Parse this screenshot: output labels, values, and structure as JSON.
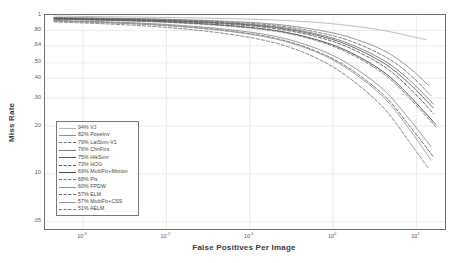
{
  "chart_data": {
    "type": "line",
    "title": "",
    "xlabel": "False Positives Per Image",
    "ylabel": "Miss Rate",
    "xscale": "log",
    "yscale": "log",
    "xlim": [
      0.00035,
      22
    ],
    "ylim": [
      0.045,
      1.0
    ],
    "grid": true,
    "legend_position": "lower-left",
    "xtick_labels": [
      "10-3",
      "10-2",
      "10-1",
      "100",
      "101"
    ],
    "xtick_values": [
      0.001,
      0.01,
      0.1,
      1,
      10
    ],
    "ytick_labels": [
      ".80",
      ".64",
      ".50",
      ".40",
      ".30",
      ".20",
      ".10",
      ".05"
    ],
    "ytick_values": [
      0.8,
      0.64,
      0.5,
      0.4,
      0.3,
      0.2,
      0.1,
      0.05
    ],
    "series": [
      {
        "name": "VJ",
        "label": "94% VJ",
        "miss_rate_pct": 94,
        "style": "solid",
        "color": "#b4b4b4",
        "width": 0.9,
        "points": [
          [
            0.00045,
            0.985
          ],
          [
            0.002,
            0.975
          ],
          [
            0.01,
            0.965
          ],
          [
            0.05,
            0.95
          ],
          [
            0.2,
            0.93
          ],
          [
            0.6,
            0.9
          ],
          [
            1.5,
            0.86
          ],
          [
            4,
            0.8
          ],
          [
            8,
            0.74
          ],
          [
            13,
            0.7
          ]
        ]
      },
      {
        "name": "PoseInv",
        "label": "82% PoseInv",
        "miss_rate_pct": 82,
        "style": "solid",
        "color": "#8c8c8c",
        "width": 0.9,
        "points": [
          [
            0.00045,
            0.965
          ],
          [
            0.002,
            0.955
          ],
          [
            0.01,
            0.94
          ],
          [
            0.05,
            0.915
          ],
          [
            0.2,
            0.875
          ],
          [
            0.6,
            0.81
          ],
          [
            1.5,
            0.73
          ],
          [
            4,
            0.6
          ],
          [
            8,
            0.47
          ],
          [
            14,
            0.36
          ]
        ]
      },
      {
        "name": "LatSvm-V1",
        "label": "79% LatSvm-V1",
        "miss_rate_pct": 79,
        "style": "dashed",
        "color": "#6e6e6e",
        "width": 0.9,
        "points": [
          [
            0.00045,
            0.96
          ],
          [
            0.002,
            0.95
          ],
          [
            0.01,
            0.935
          ],
          [
            0.05,
            0.905
          ],
          [
            0.2,
            0.86
          ],
          [
            0.6,
            0.785
          ],
          [
            1.5,
            0.695
          ],
          [
            4,
            0.555
          ],
          [
            8,
            0.43
          ],
          [
            15,
            0.31
          ]
        ]
      },
      {
        "name": "ChnFtrs",
        "label": "76% ChnFtrs",
        "miss_rate_pct": 76,
        "style": "solid",
        "color": "#7a7a7a",
        "width": 0.9,
        "points": [
          [
            0.00045,
            0.955
          ],
          [
            0.002,
            0.945
          ],
          [
            0.01,
            0.928
          ],
          [
            0.05,
            0.895
          ],
          [
            0.2,
            0.845
          ],
          [
            0.6,
            0.765
          ],
          [
            1.5,
            0.665
          ],
          [
            4,
            0.52
          ],
          [
            8,
            0.395
          ],
          [
            16,
            0.275
          ]
        ]
      },
      {
        "name": "HikSvm",
        "label": "75% HikSvm",
        "miss_rate_pct": 75,
        "style": "solid",
        "color": "#5e5e5e",
        "width": 0.9,
        "points": [
          [
            0.00045,
            0.952
          ],
          [
            0.002,
            0.94
          ],
          [
            0.01,
            0.922
          ],
          [
            0.05,
            0.888
          ],
          [
            0.2,
            0.835
          ],
          [
            0.6,
            0.752
          ],
          [
            1.5,
            0.648
          ],
          [
            4,
            0.5
          ],
          [
            8,
            0.375
          ],
          [
            16,
            0.26
          ]
        ]
      },
      {
        "name": "HOG",
        "label": "73% HOG",
        "miss_rate_pct": 73,
        "style": "dashed",
        "color": "#555555",
        "width": 0.9,
        "points": [
          [
            0.00045,
            0.948
          ],
          [
            0.002,
            0.935
          ],
          [
            0.01,
            0.915
          ],
          [
            0.05,
            0.878
          ],
          [
            0.2,
            0.822
          ],
          [
            0.6,
            0.735
          ],
          [
            1.5,
            0.628
          ],
          [
            4,
            0.478
          ],
          [
            8,
            0.352
          ],
          [
            16,
            0.24
          ]
        ]
      },
      {
        "name": "MultiFtr+Motion",
        "label": "69% MultiFtr+Motion",
        "miss_rate_pct": 69,
        "style": "solid",
        "color": "#4a4a4a",
        "width": 0.9,
        "points": [
          [
            0.00045,
            0.942
          ],
          [
            0.002,
            0.928
          ],
          [
            0.01,
            0.905
          ],
          [
            0.05,
            0.862
          ],
          [
            0.2,
            0.8
          ],
          [
            0.6,
            0.705
          ],
          [
            1.5,
            0.592
          ],
          [
            4,
            0.44
          ],
          [
            8,
            0.315
          ],
          [
            17,
            0.205
          ]
        ]
      },
      {
        "name": "Pls",
        "label": "68% Pls",
        "miss_rate_pct": 68,
        "style": "dashed",
        "color": "#707070",
        "width": 0.9,
        "points": [
          [
            0.00045,
            0.94
          ],
          [
            0.002,
            0.925
          ],
          [
            0.01,
            0.9
          ],
          [
            0.05,
            0.855
          ],
          [
            0.2,
            0.792
          ],
          [
            0.6,
            0.695
          ],
          [
            1.5,
            0.58
          ],
          [
            4,
            0.428
          ],
          [
            8,
            0.305
          ],
          [
            17,
            0.198
          ]
        ]
      },
      {
        "name": "FPDW",
        "label": "60% FPDW",
        "miss_rate_pct": 60,
        "style": "solid",
        "color": "#8f8f8f",
        "width": 0.9,
        "points": [
          [
            0.00045,
            0.925
          ],
          [
            0.002,
            0.905
          ],
          [
            0.01,
            0.872
          ],
          [
            0.05,
            0.815
          ],
          [
            0.2,
            0.735
          ],
          [
            0.6,
            0.622
          ],
          [
            1.5,
            0.495
          ],
          [
            4,
            0.34
          ],
          [
            8,
            0.225
          ],
          [
            15,
            0.148
          ]
        ]
      },
      {
        "name": "ELM",
        "label": "57% ELM",
        "miss_rate_pct": 57,
        "style": "dashed",
        "color": "#656565",
        "width": 0.9,
        "points": [
          [
            0.00045,
            0.918
          ],
          [
            0.002,
            0.896
          ],
          [
            0.01,
            0.86
          ],
          [
            0.05,
            0.8
          ],
          [
            0.2,
            0.715
          ],
          [
            0.6,
            0.598
          ],
          [
            1.5,
            0.468
          ],
          [
            4,
            0.315
          ],
          [
            8,
            0.205
          ],
          [
            16,
            0.128
          ]
        ]
      },
      {
        "name": "MultiFtr+CSS",
        "label": "57% MultiFtr+CSS",
        "miss_rate_pct": 57,
        "style": "solid",
        "color": "#9a9a9a",
        "width": 0.9,
        "points": [
          [
            0.00045,
            0.916
          ],
          [
            0.002,
            0.894
          ],
          [
            0.01,
            0.857
          ],
          [
            0.05,
            0.795
          ],
          [
            0.2,
            0.708
          ],
          [
            0.6,
            0.59
          ],
          [
            1.5,
            0.458
          ],
          [
            4,
            0.305
          ],
          [
            8,
            0.195
          ],
          [
            15,
            0.122
          ]
        ]
      },
      {
        "name": "AELM",
        "label": "51% AELM",
        "miss_rate_pct": 51,
        "style": "dashed",
        "color": "#787878",
        "width": 0.9,
        "points": [
          [
            0.00045,
            0.905
          ],
          [
            0.002,
            0.878
          ],
          [
            0.01,
            0.835
          ],
          [
            0.05,
            0.765
          ],
          [
            0.2,
            0.668
          ],
          [
            0.6,
            0.542
          ],
          [
            1.5,
            0.408
          ],
          [
            4,
            0.262
          ],
          [
            8,
            0.162
          ],
          [
            14,
            0.108
          ]
        ]
      }
    ]
  },
  "axes": {
    "ylabel": "Miss Rate",
    "xlabel": "False Positives Per Image"
  }
}
